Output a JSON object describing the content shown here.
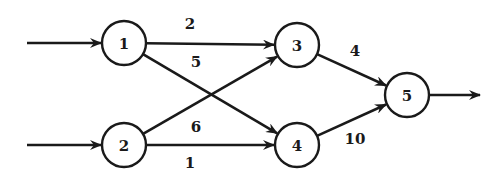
{
  "diagram": {
    "type": "directed-flow-network",
    "nodes": [
      {
        "id": "1",
        "label": "1"
      },
      {
        "id": "2",
        "label": "2"
      },
      {
        "id": "3",
        "label": "3"
      },
      {
        "id": "4",
        "label": "4"
      },
      {
        "id": "5",
        "label": "5"
      }
    ],
    "edges": [
      {
        "from": "1",
        "to": "3",
        "label": "2"
      },
      {
        "from": "1",
        "to": "4",
        "label": "5"
      },
      {
        "from": "2",
        "to": "3",
        "label": "6"
      },
      {
        "from": "2",
        "to": "4",
        "label": "1"
      },
      {
        "from": "3",
        "to": "5",
        "label": "4"
      },
      {
        "from": "4",
        "to": "5",
        "label": "10"
      }
    ],
    "inputs": [
      "1",
      "2"
    ],
    "outputs": [
      "5"
    ],
    "colors": {
      "stroke": "#1a1a1a",
      "background": "#ffffff"
    }
  }
}
